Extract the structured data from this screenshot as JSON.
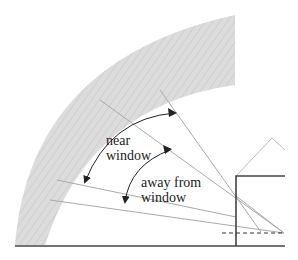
{
  "diagram": {
    "labels": {
      "near_line1": "near",
      "near_line2": "window",
      "away_line1": "away from",
      "away_line2": "window"
    },
    "colors": {
      "sky_band": "#d9d9d9",
      "ground": "#444444",
      "building": "#444444",
      "sight_lines": "#aaaaaa",
      "arrows": "#222222",
      "text": "#222222"
    }
  }
}
